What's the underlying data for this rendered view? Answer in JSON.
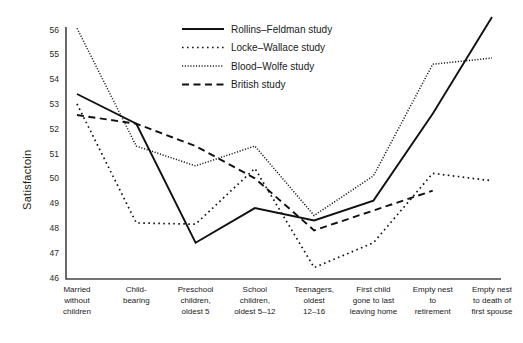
{
  "chart_data": {
    "type": "line",
    "title": "",
    "xlabel": "",
    "ylabel": "Satisfactoin",
    "ylim": [
      46,
      56
    ],
    "yticks": [
      46,
      47,
      48,
      49,
      50,
      51,
      52,
      53,
      54,
      55,
      56
    ],
    "grid": false,
    "legend_position": "top-center",
    "categories": [
      "Married without children",
      "Child-bearing",
      "Preschool children, oldest 5",
      "School children, oldest 5–12",
      "Teenagers, oldest 12–16",
      "First child gone to last leaving home",
      "Empty nest to retirement",
      "Empty nest to death of first spouse"
    ],
    "category_lines": [
      [
        "Married",
        "without",
        "children"
      ],
      [
        "Child-",
        "bearing"
      ],
      [
        "Preschool",
        "children,",
        "oldest 5"
      ],
      [
        "School",
        "children,",
        "oldest 5–12"
      ],
      [
        "Teenagers,",
        "oldest",
        "12–16"
      ],
      [
        "First child",
        "gone to last",
        "leaving home"
      ],
      [
        "Empty nest",
        "to",
        "retirement"
      ],
      [
        "Empty nest",
        "to death of",
        "first spouse"
      ]
    ],
    "series": [
      {
        "name": "Rollins–Feldman study",
        "style": "solid",
        "color": "#111111",
        "values": [
          53.4,
          52.2,
          47.4,
          48.8,
          48.3,
          49.1,
          52.6,
          56.5
        ]
      },
      {
        "name": "Locke–Wallace study",
        "style": "dotted-coarse",
        "color": "#111111",
        "values": [
          53.0,
          48.2,
          48.15,
          50.4,
          46.4,
          47.4,
          50.2,
          49.9
        ]
      },
      {
        "name": "Blood–Wolfe study",
        "style": "dotted-fine",
        "color": "#111111",
        "values": [
          56.05,
          51.3,
          50.5,
          51.3,
          48.5,
          50.1,
          54.6,
          54.85
        ]
      },
      {
        "name": "British study",
        "style": "dashed",
        "color": "#111111",
        "values": [
          52.55,
          52.2,
          51.3,
          50.0,
          47.9,
          48.7,
          49.5,
          null
        ]
      }
    ]
  },
  "legend": {
    "items": [
      {
        "label": "Rollins–Feldman study",
        "style": "solid"
      },
      {
        "label": "Locke–Wallace study",
        "style": "dotted-coarse"
      },
      {
        "label": "Blood–Wolfe study",
        "style": "dotted-fine"
      },
      {
        "label": "British study",
        "style": "dashed"
      }
    ]
  }
}
